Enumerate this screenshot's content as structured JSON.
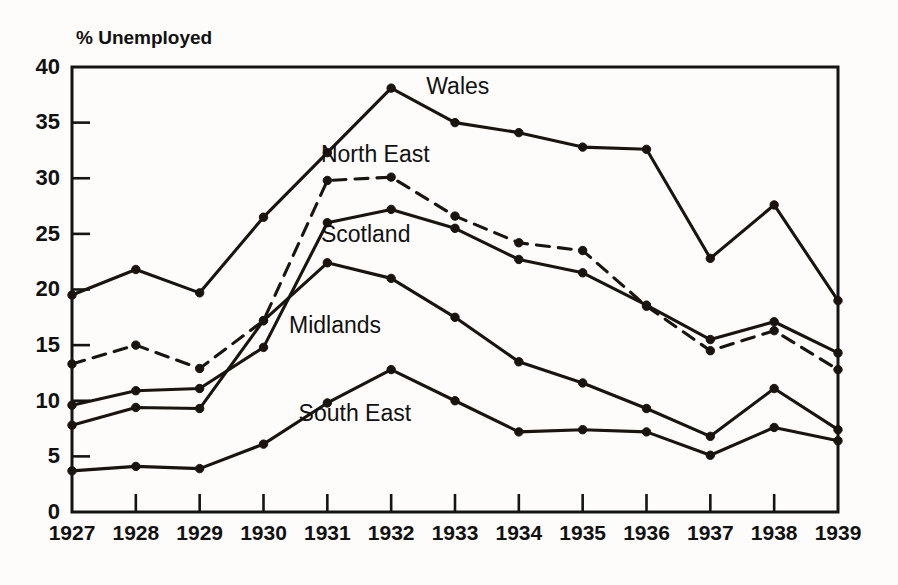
{
  "chart_data": {
    "type": "line",
    "title": "",
    "xlabel": "",
    "ylabel": "% Unemployed",
    "ylim": [
      0,
      40
    ],
    "yticks": [
      0,
      5,
      10,
      15,
      20,
      25,
      30,
      35,
      40
    ],
    "ytick_labels": [
      "0",
      "5",
      "10",
      "15",
      "20",
      "25",
      "30",
      "35",
      "40"
    ],
    "grid": false,
    "legend_position": "inline-labels",
    "categories": [
      "1927",
      "1928",
      "1929",
      "1930",
      "1931",
      "1932",
      "1933",
      "1934",
      "1935",
      "1936",
      "1937",
      "1938",
      "1939"
    ],
    "x": [
      1927,
      1928,
      1929,
      1930,
      1931,
      1932,
      1933,
      1934,
      1935,
      1936,
      1937,
      1938,
      1939
    ],
    "series": [
      {
        "name": "Wales",
        "style": "solid",
        "values": [
          19.5,
          21.8,
          19.7,
          26.5,
          32.3,
          38.1,
          35.0,
          34.1,
          32.8,
          32.6,
          22.8,
          27.6,
          19.0
        ]
      },
      {
        "name": "North East",
        "style": "dashed",
        "values": [
          13.3,
          15.0,
          12.9,
          17.2,
          29.8,
          30.1,
          26.6,
          24.2,
          23.5,
          18.5,
          14.5,
          16.3,
          12.8
        ]
      },
      {
        "name": "Scotland",
        "style": "solid",
        "values": [
          9.6,
          10.9,
          11.1,
          14.8,
          26.0,
          27.2,
          25.5,
          22.7,
          21.5,
          18.6,
          15.5,
          17.1,
          14.3
        ]
      },
      {
        "name": "Midlands",
        "style": "solid",
        "values": [
          7.8,
          9.4,
          9.3,
          17.2,
          22.4,
          21.0,
          17.5,
          13.5,
          11.6,
          9.3,
          6.8,
          11.1,
          7.4
        ]
      },
      {
        "name": "South East",
        "style": "solid",
        "values": [
          3.7,
          4.1,
          3.9,
          6.1,
          9.8,
          12.8,
          10.0,
          7.2,
          7.4,
          7.2,
          5.1,
          7.6,
          6.4
        ]
      }
    ],
    "series_label_positions": [
      {
        "name": "Wales",
        "x": 1932.55,
        "y": 37.6
      },
      {
        "name": "North East",
        "x": 1930.9,
        "y": 31.5
      },
      {
        "name": "Scotland",
        "x": 1930.9,
        "y": 24.3
      },
      {
        "name": "Midlands",
        "x": 1930.4,
        "y": 16.1
      },
      {
        "name": "South East",
        "x": 1930.55,
        "y": 8.2
      }
    ],
    "colors": {
      "line": "#1a1410",
      "axis": "#141414",
      "text": "#111111",
      "background": "#fdfcfa"
    }
  }
}
